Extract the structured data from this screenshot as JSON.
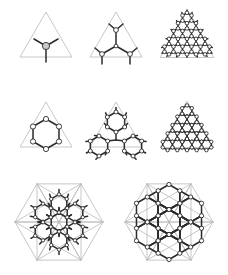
{
  "figure": {
    "title": "",
    "canvas": {
      "width": 228,
      "height": 275,
      "background": "#ffffff"
    },
    "colors": {
      "guide_line": "#b9b9b9",
      "bond": "#2b2b2b",
      "node_stroke": "#2b2b2b",
      "node_fill_open": "#ffffff",
      "node_fill_filled": "#c9c9c9"
    },
    "stroke_widths": {
      "guide": 0.8,
      "bond": 1.5
    },
    "node_radius": {
      "small": 1.9,
      "large": 3.6
    },
    "rows": 3,
    "columns": 3
  },
  "panels": [
    {
      "id": "panel-1",
      "name": "triangle-single-vertex-site",
      "label": "",
      "x": 12,
      "y": 6,
      "w": 68,
      "h": 66,
      "frame": {
        "type": "triangle",
        "cx": 34,
        "cy": 36,
        "size": 30,
        "subdivide": 0
      },
      "lattice": {
        "type": "single-site",
        "nodes": [
          {
            "x": 34,
            "y": 40,
            "r": 3.6,
            "fill": "filled"
          }
        ],
        "bonds": [
          {
            "x1": 34,
            "y1": 40,
            "x2": 22,
            "y2": 33
          },
          {
            "x1": 34,
            "y1": 40,
            "x2": 46,
            "y2": 33
          },
          {
            "x1": 34,
            "y1": 40,
            "x2": 34,
            "y2": 56
          }
        ]
      }
    },
    {
      "id": "panel-2",
      "name": "triangle-four-site-cluster",
      "label": "",
      "x": 82,
      "y": 6,
      "w": 68,
      "h": 66,
      "frame": {
        "type": "triangle",
        "cx": 34,
        "cy": 36,
        "size": 30,
        "subdivide": 0
      },
      "lattice": {
        "type": "branched-cluster",
        "nodes": [
          {
            "x": 34,
            "y": 40,
            "r": 1.9,
            "fill": "open"
          },
          {
            "x": 34,
            "y": 24,
            "r": 2.4,
            "fill": "open"
          },
          {
            "x": 20,
            "y": 48,
            "r": 2.4,
            "fill": "open"
          },
          {
            "x": 48,
            "y": 48,
            "r": 2.4,
            "fill": "open"
          }
        ],
        "bonds": [
          {
            "x1": 34,
            "y1": 40,
            "x2": 34,
            "y2": 24
          },
          {
            "x1": 34,
            "y1": 40,
            "x2": 20,
            "y2": 48
          },
          {
            "x1": 34,
            "y1": 40,
            "x2": 48,
            "y2": 48
          },
          {
            "x1": 34,
            "y1": 24,
            "x2": 27,
            "y2": 18
          },
          {
            "x1": 34,
            "y1": 24,
            "x2": 41,
            "y2": 18
          },
          {
            "x1": 20,
            "y1": 48,
            "x2": 13,
            "y2": 42
          },
          {
            "x1": 20,
            "y1": 48,
            "x2": 20,
            "y2": 58
          },
          {
            "x1": 48,
            "y1": 48,
            "x2": 55,
            "y2": 42
          },
          {
            "x1": 48,
            "y1": 48,
            "x2": 48,
            "y2": 58
          }
        ]
      }
    },
    {
      "id": "panel-3",
      "name": "triangle-dense-honeycomb",
      "label": "",
      "x": 152,
      "y": 6,
      "w": 70,
      "h": 66,
      "frame": {
        "type": "triangle",
        "cx": 35,
        "cy": 36,
        "size": 31,
        "subdivide": 0
      },
      "lattice": {
        "type": "honeycomb-triangle",
        "rows": 5,
        "hex_radius": 5.2,
        "apex": {
          "x": 35,
          "y": 12
        },
        "node_radius": 1.8,
        "dangling": true
      }
    },
    {
      "id": "panel-4",
      "name": "triangle-single-hexagon",
      "label": "",
      "x": 12,
      "y": 96,
      "w": 68,
      "h": 66,
      "frame": {
        "type": "triangle",
        "cx": 34,
        "cy": 36,
        "size": 30,
        "subdivide": 0
      },
      "lattice": {
        "type": "hexagon-ring",
        "rings": [
          {
            "cx": 34,
            "cy": 38,
            "r": 15,
            "node_r": 2.6
          }
        ]
      }
    },
    {
      "id": "panel-5",
      "name": "triangle-three-hexagons",
      "label": "",
      "x": 82,
      "y": 96,
      "w": 68,
      "h": 66,
      "frame": {
        "type": "triangle",
        "cx": 34,
        "cy": 36,
        "size": 30,
        "subdivide": 0
      },
      "lattice": {
        "type": "hexagon-ring",
        "rings": [
          {
            "cx": 34,
            "cy": 26,
            "r": 10,
            "node_r": 2.0
          },
          {
            "cx": 17,
            "cy": 50,
            "r": 10,
            "node_r": 2.0
          },
          {
            "cx": 51,
            "cy": 50,
            "r": 10,
            "node_r": 2.0
          }
        ],
        "links": [
          {
            "x1": 34,
            "y1": 34.7,
            "x2": 34,
            "y2": 44
          },
          {
            "x1": 25.4,
            "y1": 45,
            "x2": 34,
            "y2": 44
          },
          {
            "x1": 42.6,
            "y1": 45,
            "x2": 34,
            "y2": 44
          }
        ],
        "dangling": true
      }
    },
    {
      "id": "panel-6",
      "name": "triangle-packed-hexagons",
      "label": "",
      "x": 152,
      "y": 96,
      "w": 70,
      "h": 66,
      "frame": {
        "type": "triangle",
        "cx": 35,
        "cy": 36,
        "size": 31,
        "subdivide": 0
      },
      "lattice": {
        "type": "hexagon-packing",
        "rows": 5,
        "hex_radius": 5.6,
        "apex": {
          "x": 35,
          "y": 15
        },
        "node_radius": 1.7
      }
    },
    {
      "id": "panel-7",
      "name": "hexagon-dense-honeycomb",
      "label": "",
      "x": 8,
      "y": 176,
      "w": 102,
      "h": 94,
      "frame": {
        "type": "hexagon",
        "cx": 51,
        "cy": 46,
        "size": 44,
        "subdivide": 1
      },
      "lattice": {
        "type": "honeycomb-hexagon",
        "hex_radius": 9.0,
        "centers": [
          {
            "cx": 51,
            "cy": 46
          },
          {
            "cx": 51,
            "cy": 27.4
          },
          {
            "cx": 51,
            "cy": 64.6
          },
          {
            "cx": 35,
            "cy": 36.7
          },
          {
            "cx": 35,
            "cy": 55.3
          },
          {
            "cx": 67,
            "cy": 36.7
          },
          {
            "cx": 67,
            "cy": 55.3
          }
        ],
        "node_radius": 1.7,
        "dangling": true
      }
    },
    {
      "id": "panel-8",
      "name": "hexagon-seven-hexagon-flower",
      "label": "",
      "x": 118,
      "y": 176,
      "w": 102,
      "h": 94,
      "frame": {
        "type": "hexagon",
        "cx": 51,
        "cy": 46,
        "size": 44,
        "subdivide": 1
      },
      "lattice": {
        "type": "hexagon-ring",
        "rings": [
          {
            "cx": 51,
            "cy": 46,
            "r": 12.5,
            "node_r": 2.1
          },
          {
            "cx": 51,
            "cy": 21,
            "r": 12.5,
            "node_r": 2.1
          },
          {
            "cx": 51,
            "cy": 71,
            "r": 12.5,
            "node_r": 2.1
          },
          {
            "cx": 29.3,
            "cy": 33.5,
            "r": 12.5,
            "node_r": 2.1
          },
          {
            "cx": 29.3,
            "cy": 58.5,
            "r": 12.5,
            "node_r": 2.1
          },
          {
            "cx": 72.7,
            "cy": 33.5,
            "r": 12.5,
            "node_r": 2.1
          },
          {
            "cx": 72.7,
            "cy": 58.5,
            "r": 12.5,
            "node_r": 2.1
          }
        ],
        "auto_links": true,
        "link_threshold": 14
      }
    }
  ]
}
